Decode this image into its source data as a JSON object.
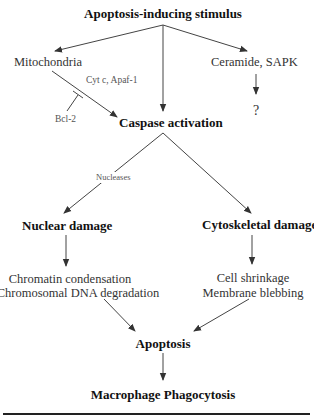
{
  "diagram": {
    "title": "Apoptosis-inducing stimulus",
    "nodes": {
      "stimulus": "Apoptosis-inducing stimulus",
      "mitochondria": "Mitochondria",
      "ceramide": "Ceramide, SAPK",
      "unknown": "?",
      "caspase": "Caspase activation",
      "nuclear": "Nuclear damage",
      "cytoskeletal": "Cytoskeletal damage",
      "chromatin": "Chromatin condensation",
      "dna": "Chromosomal DNA degradation",
      "shrinkage": "Cell shrinkage",
      "blebbing": "Membrane blebbing",
      "apoptosis": "Apoptosis",
      "phagocytosis": "Macrophage Phagocytosis"
    },
    "edge_labels": {
      "cytc": "Cyt c, Apaf-1",
      "bcl2": "Bcl-2",
      "nucleases": "Nucleases"
    },
    "colors": {
      "line": "#333333",
      "text": "#222222",
      "faint_text": "#555555"
    }
  }
}
